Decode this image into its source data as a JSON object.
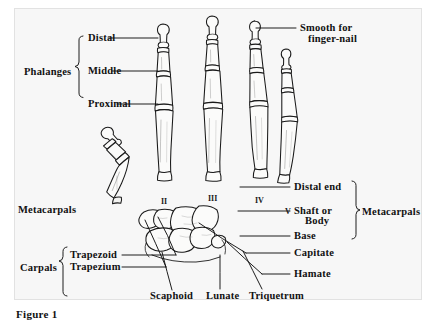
{
  "figure": {
    "caption": "Figure 1"
  },
  "brackets": {
    "phalanges": {
      "label": "Phalanges"
    },
    "carpals": {
      "label": "Carpals"
    },
    "metacarpals_right": {
      "label": "Metacarpals"
    }
  },
  "labels": {
    "distal": "Distal",
    "middle": "Middle",
    "proximal": "Proximal",
    "smooth_for_finger_nail_line1": "Smooth for",
    "smooth_for_finger_nail_line2": "finger-nail",
    "metacarpals_left": "Metacarpals",
    "distal_end": "Distal end",
    "shaft_or_line1": "Shaft or",
    "shaft_or_line2": "Body",
    "base": "Base",
    "trapezoid": "Trapezoid",
    "trapezium": "Trapezium",
    "capitate": "Capitate",
    "hamate": "Hamate",
    "scaphoid": "Scaphoid",
    "lunate": "Lunate",
    "triquetrum": "Triquetrum"
  },
  "metacarpal_numerals": {
    "two": "II",
    "three": "III",
    "four": "IV",
    "five": "V"
  },
  "colors": {
    "ink": "#111111",
    "bone_outline": "#1a1a1a",
    "bone_fill": "#fbfbfa",
    "paper": "#f7f7f7",
    "frame_border": "#e2e2e2"
  }
}
